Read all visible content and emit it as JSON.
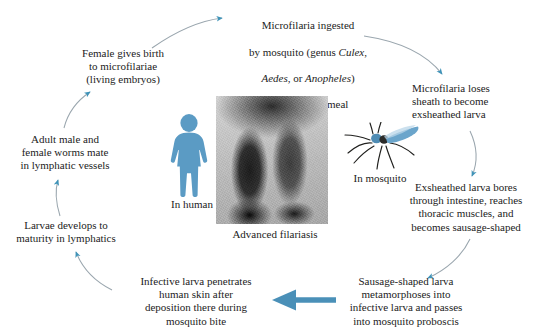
{
  "diagram": {
    "background_color": "#ffffff",
    "arrow_color": "#3f93b8",
    "arrow_line_color": "#8d9aa3",
    "bold_arrow_color": "#4a90b8",
    "human_figure_color": "#5b9bc4",
    "mosquito_body_color": "#5b9bc4"
  },
  "steps": {
    "ingested": {
      "line1": "Microfilaria ingested",
      "line2_pre": "by mosquito (genus ",
      "genus1": "Culex",
      "line2_mid": ",",
      "genus2": "Aedes",
      "line3_mid": ", or ",
      "genus3": "Anopheles",
      "line3_post": ")",
      "line4": "during blood meal"
    },
    "loses_sheath": "Microfilaria loses\nsheath to become\nexsheathed larva",
    "bores": "Exsheathed larva bores\nthrough intestine, reaches\nthoracic muscles, and\nbecomes sausage-shaped",
    "metamorphoses": "Sausage-shaped larva\nmetamorphoses into\ninfective larva and passes\ninto mosquito proboscis",
    "penetrates": "Infective larva penetrates\nhuman skin after\ndeposition there during\nmosquito bite",
    "larvae_matures": "Larvae develops to\nmaturity in lymphatics",
    "adults_mate": "Adult male and\nfemale worms mate\nin lymphatic vessels",
    "female_births": "Female gives birth\nto microfilariae\n(living embryos)"
  },
  "labels": {
    "in_human": "In human",
    "in_mosquito": "In mosquito",
    "photo_caption": "Advanced filariasis"
  }
}
